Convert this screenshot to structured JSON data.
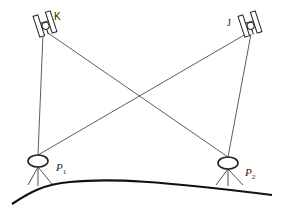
{
  "diagram": {
    "type": "photogrammetry-geometry",
    "cameras": [
      {
        "id": "K",
        "label": "K",
        "cx": 45,
        "cy": 24,
        "angle": -18
      },
      {
        "id": "J",
        "label": "J",
        "cx": 250,
        "cy": 24,
        "angle": -18
      }
    ],
    "points": [
      {
        "id": "P1",
        "label": "P",
        "subscript": "1",
        "cx": 38,
        "cy": 161
      },
      {
        "id": "P2",
        "label": "P",
        "subscript": "2",
        "cx": 228,
        "cy": 163
      }
    ],
    "rays": [
      {
        "from": "K",
        "to": "P1"
      },
      {
        "from": "K",
        "to": "P2"
      },
      {
        "from": "J",
        "to": "P1"
      },
      {
        "from": "J",
        "to": "P2"
      }
    ],
    "ground": "curved terrain line",
    "colors": {
      "line": "#333333",
      "ground": "#111111"
    }
  }
}
